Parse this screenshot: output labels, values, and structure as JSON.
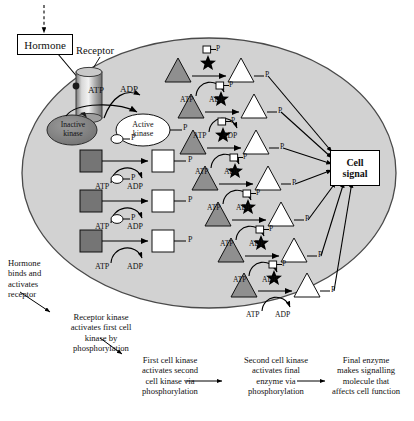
{
  "figure": {
    "title_elements": {
      "hormone_label": "Hormone",
      "receptor_label": "Receptor",
      "inactive_kinase_label_line1": "Inactive",
      "inactive_kinase_label_line2": "kinase",
      "active_kinase_label_line1": "Active",
      "active_kinase_label_line2": "kinase",
      "cell_signal_line1": "Cell",
      "cell_signal_line2": "signal"
    },
    "energy_labels": {
      "atp": "ATP",
      "adp": "ADP",
      "phosphate": "P"
    },
    "colors": {
      "cytoplasm_fill": "#d2d2d2",
      "membrane_stroke": "#4a4a4a",
      "inactive_shape_fill": "#808080",
      "active_shape_fill": "#ffffff",
      "inactive_kinase_fill": "#8a8a8a",
      "receptor_fill": "#b5b5b5",
      "star_fill": "#000000",
      "outline": "#000000"
    },
    "captions": [
      "Hormone binds and activates receptor",
      "Receptor kinase activates first cell kinase by phosphorylation",
      "First cell kinase activates second cell kinase via phosphorylation",
      "Second cell kinase activates final enzyme via phosphorylation",
      "Final enzyme makes signalling molecule that affects cell function"
    ],
    "caption_lines": {
      "c1": [
        "Hormone",
        "binds and",
        "activates",
        "receptor"
      ],
      "c2": [
        "Receptor kinase",
        "activates first cell",
        "kinase by",
        "phosphorylation"
      ],
      "c3": [
        "First cell kinase",
        "activates second",
        "cell kinase via",
        "phosphorylation"
      ],
      "c4": [
        "Second cell kinase",
        "activates final",
        "enzyme via",
        "phosphorylation"
      ],
      "c5": [
        "Final enzyme",
        "makes signalling",
        "molecule that",
        "affects cell function"
      ]
    },
    "square_cascade": {
      "count": 3,
      "substrate_state": "inactive-grey-square",
      "product_state": "active-white-square",
      "catalyst_glyph": "circle-P",
      "rows": [
        {
          "y": 160,
          "atp": "ATP",
          "adp": "ADP",
          "p": "P"
        },
        {
          "y": 200,
          "atp": "ATP",
          "adp": "ADP",
          "p": "P"
        },
        {
          "y": 240,
          "atp": "ATP",
          "adp": "ADP",
          "p": "P"
        }
      ]
    },
    "triangle_cascade": {
      "count": 7,
      "substrate_state": "inactive-grey-triangle",
      "product_state": "active-white-triangle",
      "catalyst_glyph": "square-P",
      "rows": [
        {
          "x": 165,
          "y": 68,
          "atp": "ATP",
          "adp": "ADP",
          "p": "P"
        },
        {
          "x": 178,
          "y": 104,
          "atp": "ATP",
          "adp": "ADP",
          "p": "P"
        },
        {
          "x": 180,
          "y": 140,
          "atp": "ATP",
          "adp": "ADP",
          "p": "P"
        },
        {
          "x": 192,
          "y": 176,
          "atp": "ATP",
          "adp": "ADP",
          "p": "P"
        },
        {
          "x": 205,
          "y": 212,
          "atp": "ATP",
          "adp": "ADP",
          "p": "P"
        },
        {
          "x": 218,
          "y": 248,
          "atp": "ATP",
          "adp": "ADP",
          "p": "P"
        },
        {
          "x": 231,
          "y": 283,
          "atp": "ATP",
          "adp": "ADP",
          "p": "P"
        }
      ]
    },
    "signal_arrow_count": 7
  }
}
